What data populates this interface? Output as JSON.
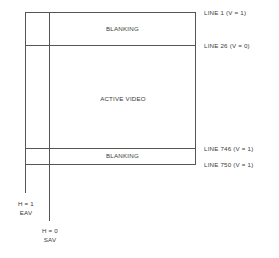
{
  "diagram": {
    "regions": {
      "top_blanking": "BLANKING",
      "active_video": "ACTIVE VIDEO",
      "bottom_blanking": "BLANKING"
    },
    "line_markers": [
      {
        "label": "LINE 1 (V = 1)",
        "line": 1,
        "v": 1
      },
      {
        "label": "LINE 26 (V = 0)",
        "line": 26,
        "v": 0
      },
      {
        "label": "LINE 746 (V = 1)",
        "line": 746,
        "v": 1
      },
      {
        "label": "LINE 750 (V = 1)",
        "line": 750,
        "v": 1
      }
    ],
    "h_markers": [
      {
        "h_label": "H = 1",
        "code": "EAV",
        "h": 1
      },
      {
        "h_label": "H = 0",
        "code": "SAV",
        "h": 0
      }
    ],
    "colors": {
      "line": "#555555",
      "text": "#3a3a3a",
      "background": "#ffffff"
    }
  }
}
